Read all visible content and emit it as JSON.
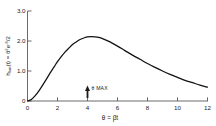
{
  "figure": {
    "background_color": "#ffffff",
    "line_color": "#111111",
    "axis_color": "#5a5a5a",
    "text_color": "#1a1a1a"
  },
  "axes": {
    "y_axis_label_parts": {
      "h": "h",
      "sub_bm": "bm",
      "of_t": "(t) = ",
      "theta": "θ",
      "exp2": "2",
      "e": "e",
      "exp_minus_theta": "-θ",
      "over_two": "/2"
    },
    "y_axis_label_plain": "h bm(t) = θ²e⁻ᵟ/2",
    "x_axis_label": "θ = βt",
    "x_ticks": [
      "0",
      "2",
      "4",
      "6",
      "8",
      "10",
      "12"
    ],
    "y_ticks": [
      "0",
      "1.0",
      "2.0",
      "3.0"
    ]
  },
  "annotations": [
    {
      "name": "theta-max",
      "label": "θ MAX",
      "x_value": 4,
      "marker": "up-arrow"
    }
  ],
  "chart_data": {
    "type": "line",
    "title": "",
    "xlabel": "θ = βt",
    "ylabel": "h bm(t) = θ²e⁻ᵟ/2",
    "xlim": [
      0,
      12
    ],
    "ylim": [
      0,
      3.0
    ],
    "xticks": [
      0,
      2,
      4,
      6,
      8,
      10,
      12
    ],
    "yticks": [
      0,
      1.0,
      2.0,
      3.0
    ],
    "grid": false,
    "legend": "none",
    "series": [
      {
        "name": "h_bm(t)",
        "x": [
          0,
          0.25,
          0.5,
          0.75,
          1.0,
          1.25,
          1.5,
          1.75,
          2.0,
          2.25,
          2.5,
          2.75,
          3.0,
          3.25,
          3.5,
          3.75,
          4.0,
          4.25,
          4.5,
          4.75,
          5.0,
          5.5,
          6.0,
          6.5,
          7.0,
          7.5,
          8.0,
          8.5,
          9.0,
          9.5,
          10.0,
          10.5,
          11.0,
          11.5,
          12.0
        ],
        "y": [
          0.0,
          0.05,
          0.17,
          0.33,
          0.52,
          0.72,
          0.93,
          1.12,
          1.31,
          1.48,
          1.63,
          1.76,
          1.88,
          1.97,
          2.05,
          2.1,
          2.14,
          2.15,
          2.14,
          2.12,
          2.08,
          1.97,
          1.83,
          1.68,
          1.53,
          1.39,
          1.25,
          1.12,
          1.0,
          0.89,
          0.79,
          0.69,
          0.61,
          0.53,
          0.46
        ]
      }
    ],
    "annotations": [
      {
        "text": "θ MAX",
        "x": 4,
        "y": 0
      }
    ]
  }
}
